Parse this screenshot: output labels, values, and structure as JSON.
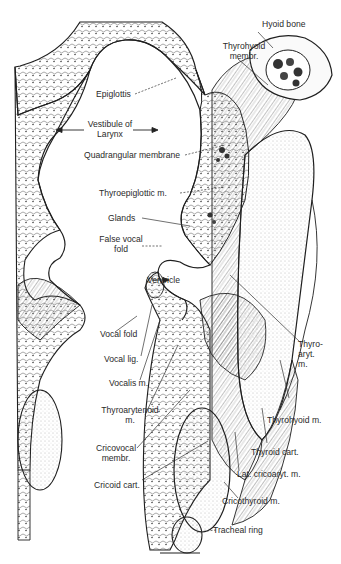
{
  "figure": {
    "colors": {
      "ink": "#1f1f1f",
      "paper": "#ffffff",
      "stipple": "#6b6b6b"
    }
  },
  "labels": {
    "hyoid_bone": "Hyoid bone",
    "thyrohyoid_membr_1": "Thyrohyoid",
    "thyrohyoid_membr_2": "membr.",
    "epiglottis": "Epiglottis",
    "vestibule_1": "Vestibule of",
    "vestibule_2": "Larynx",
    "quadrangular_membrane": "Quadrangular membrane",
    "thyroepiglottic_m": "Thyroepiglottic m.",
    "glands": "Glands",
    "false_vocal_fold_1": "False vocal",
    "false_vocal_fold_2": "fold",
    "ventricle": "Ventricle",
    "thyro_aryt_m_1": "Thyro-",
    "thyro_aryt_m_2": "aryt.",
    "thyro_aryt_m_3": "m.",
    "vocal_fold": "Vocal fold",
    "vocal_lig": "Vocal lig.",
    "vocalis_m": "Vocalis m.",
    "thyroarytenoid_m_1": "Thyroarytenoid",
    "thyroarytenoid_m_2": "m.",
    "thyrohyoid_m": "Thyrohyoid m.",
    "thyroid_cart": "Thyroid cart.",
    "cricovocal_membr_1": "Cricovocal",
    "cricovocal_membr_2": "membr.",
    "lat_cricoaryt_m": "Lat. cricoaryt. m.",
    "cricoid_cart": "Cricoid cart.",
    "cricothyroid_m": "Cricothyroid m.",
    "tracheal_ring": "Tracheal ring"
  }
}
